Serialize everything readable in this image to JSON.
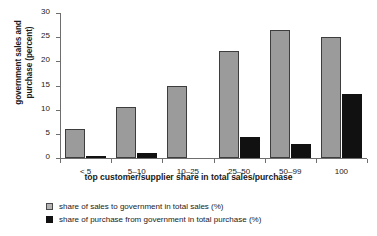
{
  "chart_data": {
    "type": "bar",
    "title": "",
    "xlabel": "top customer/supplier share in total sales/purchase",
    "ylabel": "government sales and purchase (percent)",
    "ylabel_lines": [
      "government sales and",
      "purchase (percent)"
    ],
    "categories": [
      "< 5",
      "5–10",
      "10–25",
      "25–50",
      "50–99",
      "100"
    ],
    "ylim": [
      0,
      30
    ],
    "yticks": [
      0,
      5,
      10,
      15,
      20,
      25,
      30
    ],
    "ytick_labels": [
      "0",
      "5",
      "10",
      "15",
      "20",
      "25",
      "30"
    ],
    "grid": false,
    "legend_position": "below-left",
    "series": [
      {
        "name": "share of sales to government in total sales (%)",
        "color": "#9b9b9b",
        "values": [
          5.9,
          10.6,
          15.0,
          22.2,
          26.5,
          25.0
        ]
      },
      {
        "name": "share of purchase from government in total purchase (%)",
        "color": "#111111",
        "values": [
          0.4,
          1.0,
          0.0,
          4.4,
          2.9,
          13.2
        ]
      }
    ]
  }
}
